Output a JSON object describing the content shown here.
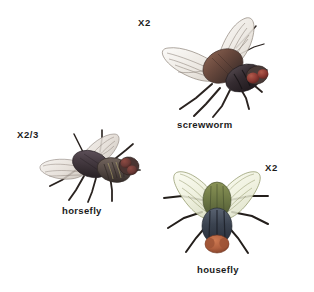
{
  "plate": {
    "title": "Fly identification plate",
    "background_color": "#ffffff",
    "width": 314,
    "height": 292
  },
  "specimens": [
    {
      "id": "screwworm",
      "common_name": "screwworm",
      "magnification": "X2",
      "view": "dorsolateral",
      "colors": {
        "thorax": "#6b4a3e",
        "abdomen": "#3a3036",
        "eye": "#8d3a33",
        "wing": "#efeae4",
        "wing_vein": "#6e6258",
        "leg": "#2a2320"
      }
    },
    {
      "id": "horsefly",
      "common_name": "horsefly",
      "magnification": "X2/3",
      "view": "dorsolateral",
      "colors": {
        "thorax": "#4e4249",
        "abdomen": "#5b4f4a",
        "eye": "#6b3a36",
        "wing": "#e6e0da",
        "wing_vein": "#7a6f66",
        "leg": "#2a2320",
        "abdomen_stripe": "#b9ae6e"
      }
    },
    {
      "id": "housefly",
      "common_name": "housefly",
      "magnification": "X2",
      "view": "dorsal",
      "colors": {
        "thorax": "#6f7a46",
        "abdomen": "#3b4350",
        "head": "#b0603f",
        "wing": "#eef0dc",
        "wing_vein": "#8a9060",
        "leg": "#231e1b"
      }
    }
  ],
  "labels": {
    "screwworm_mag": "X2",
    "screwworm_name": "screwworm",
    "horsefly_mag": "X2/3",
    "horsefly_name": "horsefly",
    "housefly_mag": "X2",
    "housefly_name": "housefly"
  }
}
